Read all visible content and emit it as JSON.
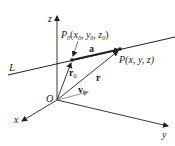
{
  "figure": {
    "axes": {
      "x_label": "x",
      "y_label": "y",
      "z_label": "z",
      "origin_label": "O"
    },
    "line_label": "L",
    "points": {
      "p0": {
        "name": "P",
        "subscript": "0",
        "coords": "(x",
        "coords_full": "P0(x0, y0, z0)"
      },
      "p": {
        "label": "P(x, y, z)"
      }
    },
    "vectors": {
      "a": "a",
      "r0": "r",
      "r0_sub": "0",
      "r": "r",
      "v": "v"
    },
    "colors": {
      "stroke": "#222222",
      "v_vector": "#8a8a8a"
    }
  }
}
